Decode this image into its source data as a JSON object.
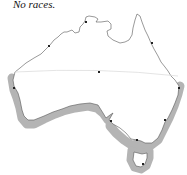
{
  "caption": "No races.",
  "map": {
    "region": "Australia",
    "colors": {
      "background": "#ffffff",
      "coastline": "#555555",
      "highlight_band": "#b4b4b4",
      "divider_line": "#dddddd",
      "marker": "#222222"
    },
    "highlighted_region": "southern coastline",
    "markers": [
      {
        "name": "darwin",
        "x": 86,
        "y": 22
      },
      {
        "name": "broome",
        "x": 49,
        "y": 46
      },
      {
        "name": "cairns",
        "x": 151,
        "y": 43
      },
      {
        "name": "centre",
        "x": 99,
        "y": 72
      },
      {
        "name": "brisbane",
        "x": 179,
        "y": 88
      },
      {
        "name": "perth",
        "x": 14,
        "y": 88
      },
      {
        "name": "adelaide",
        "x": 111,
        "y": 121
      },
      {
        "name": "sydney",
        "x": 165,
        "y": 120
      },
      {
        "name": "melbourne",
        "x": 137,
        "y": 140
      },
      {
        "name": "hobart",
        "x": 143,
        "y": 164
      }
    ]
  }
}
